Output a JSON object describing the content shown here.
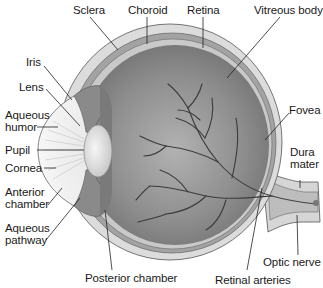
{
  "diagram": {
    "colors": {
      "background": "#ffffff",
      "sclera": "#d9d9d9",
      "choroid": "#9a9a9a",
      "retina": "#c4c4c4",
      "vitreous": "#8c8c8c",
      "vessels": "#3a3a3a",
      "lens": "#e8e8e8",
      "leader_lines": "#222222",
      "text": "#1a1a1a"
    },
    "labels": {
      "sclera": "Sclera",
      "choroid": "Choroid",
      "retina": "Retina",
      "vitreous_body": "Vitreous body",
      "iris": "Iris",
      "lens": "Lens",
      "aqueous_humor_1": "Aqueous",
      "aqueous_humor_2": "humor",
      "pupil": "Pupil",
      "cornea": "Cornea",
      "anterior_chamber_1": "Anterior",
      "anterior_chamber_2": "chamber",
      "aqueous_pathway_1": "Aqueous",
      "aqueous_pathway_2": "pathway",
      "posterior_chamber": "Posterior chamber",
      "retinal_arteries": "Retinal arteries",
      "optic_nerve": "Optic nerve",
      "fovea": "Fovea",
      "dura_mater_1": "Dura",
      "dura_mater_2": "mater"
    }
  }
}
